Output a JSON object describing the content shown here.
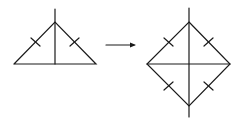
{
  "diagram": {
    "stroke_color": "#1a1a1a",
    "background": "#ffffff",
    "left_figure": {
      "shape": "isosceles-triangle",
      "vertices": {
        "apex": [
          55,
          22
        ],
        "base_left": [
          14,
          64
        ],
        "base_right": [
          96,
          64
        ]
      },
      "altitude": {
        "from": [
          55,
          9
        ],
        "to": [
          55,
          64
        ]
      },
      "tick_marks": 2
    },
    "arrow": {
      "from": [
        106,
        45
      ],
      "to": [
        136,
        45
      ],
      "direction": "right"
    },
    "right_figure": {
      "shape": "rhombus",
      "vertices": {
        "top": [
          189,
          22
        ],
        "left": [
          147,
          64
        ],
        "right": [
          230,
          64
        ],
        "bottom": [
          189,
          106
        ]
      },
      "vertical_diagonal": {
        "from": [
          189,
          8
        ],
        "to": [
          189,
          117
        ]
      },
      "horizontal_diagonal": {
        "from": [
          147,
          64
        ],
        "to": [
          230,
          64
        ]
      },
      "tick_marks": 4
    }
  }
}
